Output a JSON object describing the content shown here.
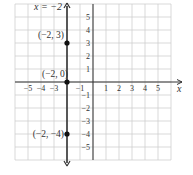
{
  "chart_data": {
    "type": "line",
    "title": "",
    "equation_label": "x = −2",
    "xlabel": "x",
    "ylabel": "",
    "xlim": [
      -6,
      6
    ],
    "ylim": [
      -6,
      6
    ],
    "grid": true,
    "x_ticks": [
      "−5",
      "−4",
      "−3",
      "−1",
      "1",
      "2",
      "3",
      "4",
      "5"
    ],
    "x_tick_values": [
      -5,
      -4,
      -3,
      -1,
      1,
      2,
      3,
      4,
      5
    ],
    "y_ticks": [
      "5",
      "4",
      "3",
      "2",
      "1",
      "−1",
      "−2",
      "−3",
      "−4",
      "−5"
    ],
    "y_tick_values": [
      5,
      4,
      3,
      2,
      1,
      -1,
      -2,
      -3,
      -4,
      -5
    ],
    "series": [
      {
        "name": "x = −2",
        "type": "vertical-line",
        "x": -2,
        "color": "#333333"
      }
    ],
    "points": [
      {
        "label": "(−2, 3)",
        "x": -2,
        "y": 3
      },
      {
        "label": "(−2, 0)",
        "x": -2,
        "y": 0
      },
      {
        "label": "(−2, −4)",
        "x": -2,
        "y": -4
      }
    ]
  },
  "colors": {
    "grid": "#cfcfcf",
    "axis": "#333333",
    "line": "#333333",
    "point": "#111111"
  }
}
